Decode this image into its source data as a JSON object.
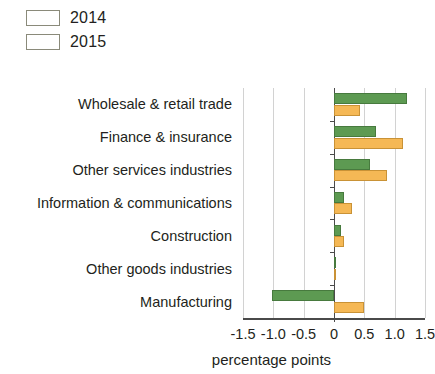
{
  "legend": {
    "position": "top-left",
    "items": [
      {
        "label": "2014",
        "color": "#f5b855"
      },
      {
        "label": "2015",
        "color": "#5d9a52"
      }
    ]
  },
  "axis": {
    "x_title": "percentage points",
    "tick_labels": [
      "-1.5",
      "-1.0",
      "-0.5",
      "0",
      "0.5",
      "1.0",
      "1.5"
    ],
    "tick_values": [
      -1.5,
      -1.0,
      -0.5,
      0,
      0.5,
      1.0,
      1.5
    ]
  },
  "chart_data": {
    "type": "bar",
    "orientation": "horizontal",
    "title": "",
    "subtitle": "",
    "xlabel": "percentage points",
    "ylabel": "",
    "xlim": [
      -1.5,
      1.5
    ],
    "grid": true,
    "legend_position": "top-left",
    "categories": [
      "Wholesale & retail trade",
      "Finance & insurance",
      "Other services industries",
      "Information & communications",
      "Construction",
      "Other goods industries",
      "Manufacturing"
    ],
    "series": [
      {
        "name": "2014",
        "color": "#f5b855",
        "values": [
          0.43,
          1.13,
          0.87,
          0.29,
          0.17,
          0.02,
          0.49
        ]
      },
      {
        "name": "2015",
        "color": "#5d9a52",
        "values": [
          1.2,
          0.7,
          0.59,
          0.17,
          0.11,
          0.02,
          -1.02
        ]
      }
    ]
  }
}
